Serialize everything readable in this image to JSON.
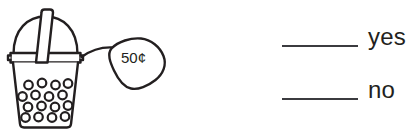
{
  "illustration": {
    "name": "bubble-tea-cup-with-price-tag",
    "price_tag": {
      "value": "50¢"
    },
    "stroke_color": "#231f20",
    "fill_color": "#ffffff",
    "pearl_count": 16
  },
  "answer_options": [
    {
      "key": "yes",
      "label": "yes"
    },
    {
      "key": "no",
      "label": "no"
    }
  ],
  "colors": {
    "ink": "#231f20",
    "line": "#3b3b3f",
    "paper": "#ffffff"
  }
}
